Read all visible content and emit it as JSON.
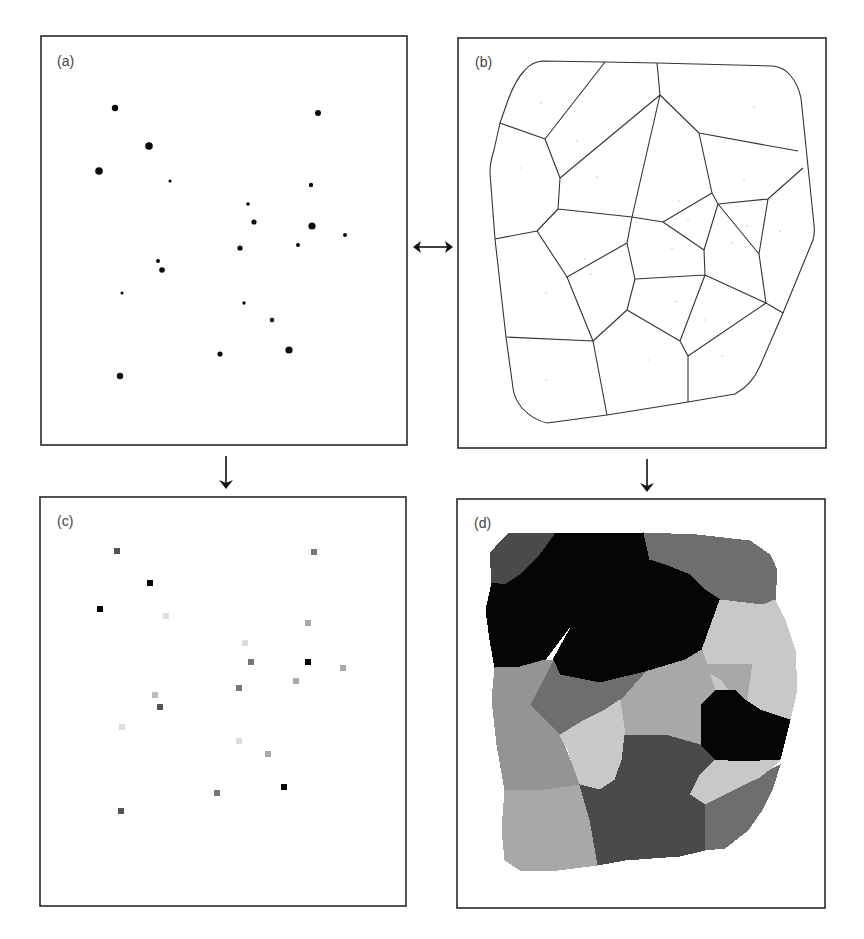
{
  "figure": {
    "panels": [
      {
        "id": "a",
        "label": "(a)",
        "description": "Point observations with values shown by dot size"
      },
      {
        "id": "b",
        "label": "(b)",
        "description": "Voronoi (Thiessen) polygons around the points"
      },
      {
        "id": "c",
        "label": "(c)",
        "description": "Points rasterized as grey-valued cells"
      },
      {
        "id": "d",
        "label": "(d)",
        "description": "Rasterized Thiessen polygons filled with point values"
      }
    ],
    "arrows": [
      {
        "from": "a",
        "to": "b",
        "type": "double-horizontal"
      },
      {
        "from": "a",
        "to": "c",
        "type": "down"
      },
      {
        "from": "b",
        "to": "d",
        "type": "down"
      }
    ],
    "caption": ""
  },
  "points_a": [
    {
      "x": 115,
      "y": 108,
      "r": 3.2
    },
    {
      "x": 318,
      "y": 113,
      "r": 3.0
    },
    {
      "x": 149,
      "y": 146,
      "r": 3.8
    },
    {
      "x": 99,
      "y": 171,
      "r": 3.8
    },
    {
      "x": 170,
      "y": 181,
      "r": 1.6
    },
    {
      "x": 311,
      "y": 185,
      "r": 2.2
    },
    {
      "x": 248,
      "y": 204,
      "r": 1.8
    },
    {
      "x": 254,
      "y": 222,
      "r": 2.6
    },
    {
      "x": 312,
      "y": 226,
      "r": 3.6
    },
    {
      "x": 345,
      "y": 235,
      "r": 2.0
    },
    {
      "x": 240,
      "y": 248,
      "r": 2.6
    },
    {
      "x": 298,
      "y": 245,
      "r": 2.0
    },
    {
      "x": 158,
      "y": 261,
      "r": 2.0
    },
    {
      "x": 162,
      "y": 270,
      "r": 2.8
    },
    {
      "x": 122,
      "y": 293,
      "r": 1.5
    },
    {
      "x": 244,
      "y": 303,
      "r": 1.7
    },
    {
      "x": 272,
      "y": 320,
      "r": 2.2
    },
    {
      "x": 220,
      "y": 354,
      "r": 2.6
    },
    {
      "x": 289,
      "y": 350,
      "r": 3.6
    },
    {
      "x": 120,
      "y": 376,
      "r": 3.2
    }
  ],
  "cells_c": [
    {
      "x": 117,
      "y": 551,
      "fill": "#555555"
    },
    {
      "x": 314,
      "y": 552,
      "fill": "#7a7a7a"
    },
    {
      "x": 150,
      "y": 583,
      "fill": "#050505"
    },
    {
      "x": 100,
      "y": 609,
      "fill": "#050505"
    },
    {
      "x": 166,
      "y": 616,
      "fill": "#dddddd"
    },
    {
      "x": 308,
      "y": 623,
      "fill": "#aaaaaa"
    },
    {
      "x": 245,
      "y": 643,
      "fill": "#dddddd"
    },
    {
      "x": 251,
      "y": 662,
      "fill": "#777777"
    },
    {
      "x": 308,
      "y": 662,
      "fill": "#050505"
    },
    {
      "x": 343,
      "y": 668,
      "fill": "#aaaaaa"
    },
    {
      "x": 296,
      "y": 681,
      "fill": "#aaaaaa"
    },
    {
      "x": 239,
      "y": 688,
      "fill": "#777777"
    },
    {
      "x": 155,
      "y": 695,
      "fill": "#bbbbbb"
    },
    {
      "x": 160,
      "y": 707,
      "fill": "#555555"
    },
    {
      "x": 122,
      "y": 727,
      "fill": "#dddddd"
    },
    {
      "x": 239,
      "y": 741,
      "fill": "#dddddd"
    },
    {
      "x": 268,
      "y": 754,
      "fill": "#aaaaaa"
    },
    {
      "x": 284,
      "y": 787,
      "fill": "#050505"
    },
    {
      "x": 217,
      "y": 793,
      "fill": "#777777"
    },
    {
      "x": 121,
      "y": 811,
      "fill": "#555555"
    }
  ],
  "regions_d": [
    {
      "name": "top-left",
      "fill": "#4a4a4a"
    },
    {
      "name": "top-diagonal",
      "fill": "#050505"
    },
    {
      "name": "top-right",
      "fill": "#6e6e6e"
    },
    {
      "name": "left-upper",
      "fill": "#050505"
    },
    {
      "name": "center-upper",
      "fill": "#c8c8c8"
    },
    {
      "name": "right-upper",
      "fill": "#a8a8a8"
    },
    {
      "name": "small-triangle",
      "fill": "#050505"
    },
    {
      "name": "right-mid",
      "fill": "#a8a8a8"
    },
    {
      "name": "center-mid",
      "fill": "#6e6e6e"
    },
    {
      "name": "left-mid",
      "fill": "#949494"
    },
    {
      "name": "left-lower",
      "fill": "#c8c8c8"
    },
    {
      "name": "center-dark",
      "fill": "#4a4a4a"
    },
    {
      "name": "center-light",
      "fill": "#c8c8c8"
    },
    {
      "name": "right-lower",
      "fill": "#a8a8a8"
    },
    {
      "name": "bottom-left",
      "fill": "#4a4a4a"
    },
    {
      "name": "bottom-center",
      "fill": "#6e6e6e"
    },
    {
      "name": "bottom-right",
      "fill": "#050505"
    }
  ]
}
